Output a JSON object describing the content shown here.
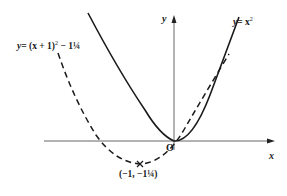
{
  "figure": {
    "curves": [
      {
        "name": "y = x²",
        "style": "solid",
        "vertex": [
          0,
          0
        ]
      },
      {
        "name": "y = (x + 1)² − 1¼",
        "style": "dashed",
        "vertex": [
          -1,
          -1.25
        ]
      }
    ],
    "labels": {
      "parabola_basic_y": "y",
      "parabola_basic_eq": "= x",
      "parabola_basic_exp": "2",
      "parabola_shift_y": "y",
      "parabola_shift_eq_a": "= (x + 1)",
      "parabola_shift_exp": "2",
      "parabola_shift_eq_b": " − 1¼",
      "vertex_point": "(−1, −1¼)",
      "origin": "O",
      "x_axis": "x",
      "y_axis": "y"
    },
    "colors": {
      "ink": "#1a1a1a",
      "axis": "#555555",
      "background": "#ffffff"
    }
  }
}
